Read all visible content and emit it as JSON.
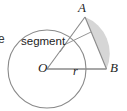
{
  "figure": {
    "type": "circle-segment-geometry-diagram",
    "labels": {
      "point_a": "A",
      "point_b": "B",
      "center_o": "O",
      "radius": "r",
      "segment": "segment",
      "clipped_left_text": "e"
    },
    "colors": {
      "stroke": "#8a8a8a",
      "text": "#1d1d1d",
      "shade_fill": "#d6d6d6",
      "background": "#ffffff"
    },
    "geometry": {
      "circle": {
        "cx": 47,
        "cy": 69,
        "r": 39
      },
      "point_a": {
        "x": 85,
        "y": 17
      },
      "point_b": {
        "x": 106.5,
        "y": 69
      },
      "radius_line": "O to B",
      "chord": "A to B",
      "shaded_region": "circular segment between chord AB and minor arc AB",
      "leader_line": "from segment label to shaded region"
    }
  }
}
